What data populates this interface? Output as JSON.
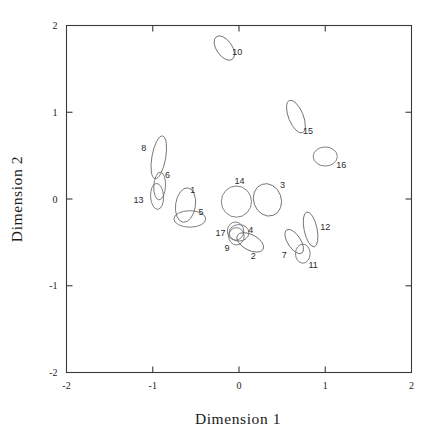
{
  "chart_data": {
    "type": "scatter",
    "title": "",
    "xlabel": "Dimension 1",
    "ylabel": "Dimension 2",
    "xlim": [
      -2,
      2
    ],
    "ylim": [
      -2,
      2
    ],
    "xticks": [
      "-2",
      "-1",
      "0",
      "1",
      "2"
    ],
    "yticks": [
      "-2",
      "-1",
      "0",
      "1",
      "2"
    ],
    "xtick_values": [
      -2,
      -1,
      0,
      1,
      2
    ],
    "ytick_values": [
      -2,
      -1,
      0,
      1,
      2
    ],
    "grid": false,
    "legend": "none",
    "marker_shape": "ellipse",
    "note": "Confidence ellipses for 17 objects in a two-dimensional solution",
    "points": [
      {
        "label": "1",
        "x": -0.62,
        "y": -0.07,
        "rx": 0.115,
        "ry": 0.2,
        "angle": -8,
        "label_dx": 0.085,
        "label_dy": 0.175
      },
      {
        "label": "2",
        "x": 0.13,
        "y": -0.5,
        "rx": 0.17,
        "ry": 0.09,
        "angle": -28,
        "label_dx": 0.035,
        "label_dy": -0.155
      },
      {
        "label": "3",
        "x": 0.33,
        "y": -0.01,
        "rx": 0.16,
        "ry": 0.19,
        "angle": 20,
        "label_dx": 0.175,
        "label_dy": 0.175
      },
      {
        "label": "4",
        "x": 0.0,
        "y": -0.39,
        "rx": 0.115,
        "ry": 0.095,
        "angle": 0,
        "label_dx": 0.135,
        "label_dy": 0.04
      },
      {
        "label": "5",
        "x": -0.57,
        "y": -0.23,
        "rx": 0.185,
        "ry": 0.095,
        "angle": 0,
        "label_dx": 0.13,
        "label_dy": 0.085
      },
      {
        "label": "6",
        "x": -0.92,
        "y": 0.15,
        "rx": 0.068,
        "ry": 0.16,
        "angle": -3,
        "label_dx": 0.09,
        "label_dy": 0.13
      },
      {
        "label": "7",
        "x": 0.64,
        "y": -0.49,
        "rx": 0.075,
        "ry": 0.16,
        "angle": 33,
        "label_dx": -0.115,
        "label_dy": -0.155
      },
      {
        "label": "8",
        "x": -0.93,
        "y": 0.48,
        "rx": 0.08,
        "ry": 0.25,
        "angle": -10,
        "label_dx": -0.175,
        "label_dy": 0.11
      },
      {
        "label": "9",
        "x": -0.03,
        "y": -0.43,
        "rx": 0.09,
        "ry": 0.1,
        "angle": 0,
        "label_dx": -0.11,
        "label_dy": -0.13
      },
      {
        "label": "10",
        "x": -0.17,
        "y": 1.74,
        "rx": 0.09,
        "ry": 0.16,
        "angle": 35,
        "label_dx": 0.15,
        "label_dy": -0.045
      },
      {
        "label": "11",
        "x": 0.74,
        "y": -0.63,
        "rx": 0.085,
        "ry": 0.11,
        "angle": 0,
        "label_dx": 0.12,
        "label_dy": -0.13
      },
      {
        "label": "12",
        "x": 0.83,
        "y": -0.35,
        "rx": 0.075,
        "ry": 0.205,
        "angle": 12,
        "label_dx": 0.17,
        "label_dy": 0.035
      },
      {
        "label": "13",
        "x": -0.95,
        "y": 0.03,
        "rx": 0.075,
        "ry": 0.15,
        "angle": 3,
        "label_dx": -0.215,
        "label_dy": -0.03
      },
      {
        "label": "14",
        "x": -0.03,
        "y": -0.03,
        "rx": 0.175,
        "ry": 0.18,
        "angle": 0,
        "label_dx": 0.035,
        "label_dy": 0.245
      },
      {
        "label": "15",
        "x": 0.66,
        "y": 0.95,
        "rx": 0.085,
        "ry": 0.2,
        "angle": 22,
        "label_dx": 0.14,
        "label_dy": -0.165
      },
      {
        "label": "16",
        "x": 1.0,
        "y": 0.49,
        "rx": 0.14,
        "ry": 0.11,
        "angle": 0,
        "label_dx": 0.185,
        "label_dy": -0.09
      },
      {
        "label": "17",
        "x": -0.04,
        "y": -0.37,
        "rx": 0.095,
        "ry": 0.105,
        "angle": 0,
        "label_dx": -0.175,
        "label_dy": -0.02
      }
    ]
  }
}
